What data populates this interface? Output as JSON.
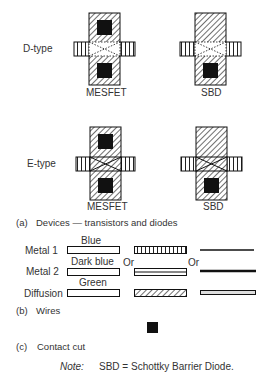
{
  "devices": {
    "rows": [
      {
        "label": "D-type",
        "mesfet_label": "MESFET",
        "sbd_label": "SBD"
      },
      {
        "label": "E-type",
        "mesfet_label": "MESFET",
        "sbd_label": "SBD"
      }
    ],
    "caption_letter": "(a)",
    "caption_text": "Devices — transistors and diodes"
  },
  "wires": {
    "rows": [
      {
        "label": "Metal 1",
        "color_name": "Blue"
      },
      {
        "label": "Metal 2",
        "color_name": "Dark blue"
      },
      {
        "label": "Diffusion",
        "color_name": "Green"
      }
    ],
    "or_labels": [
      "Or",
      "Or"
    ],
    "caption_letter": "(b)",
    "caption_text": "Wires"
  },
  "contact": {
    "caption_letter": "(c)",
    "caption_text": "Contact cut"
  },
  "note": {
    "label": "Note:",
    "text": "SBD = Schottky Barrier Diode."
  },
  "colors": {
    "ink": "#111111",
    "background": "#ffffff"
  }
}
